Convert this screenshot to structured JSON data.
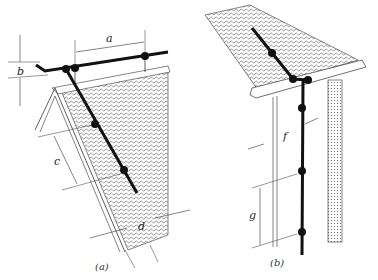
{
  "figure": {
    "panels": [
      {
        "id": "a",
        "caption": "(a)",
        "description": "Gable roof ridge with lightning conductor and supports",
        "dimensions": [
          "a",
          "b",
          "c",
          "d"
        ]
      },
      {
        "id": "b",
        "caption": "(b)",
        "description": "Roof eave with down conductor along wall",
        "dimensions": [
          "f",
          "g"
        ]
      }
    ],
    "labels": {
      "a": "a",
      "b": "b",
      "c": "c",
      "d": "d",
      "f": "f",
      "g": "g"
    },
    "captions": {
      "a": "(a)",
      "b": "(b)"
    },
    "colors": {
      "line": "#111111",
      "hatch": "#555555",
      "background": "#ffffff"
    }
  }
}
